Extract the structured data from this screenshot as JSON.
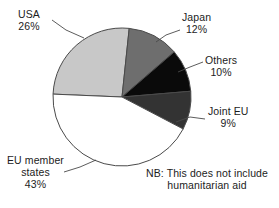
{
  "chart_data": {
    "type": "pie",
    "title": "",
    "subtitle": "",
    "xlabel": "",
    "ylabel": "",
    "legend_position": "none",
    "grid": false,
    "unit": "%",
    "categories": [
      "Japan",
      "Others",
      "Joint EU",
      "EU member states",
      "USA"
    ],
    "values": [
      12,
      10,
      9,
      43,
      26
    ],
    "slices": [
      {
        "id": "japan",
        "label": "Japan",
        "value": 12,
        "value_text": "12%",
        "color": "#6e6e6e",
        "start_angle": 352,
        "end_angle": 395,
        "label_lines": [
          "Japan",
          "12%"
        ]
      },
      {
        "id": "others",
        "label": "Others",
        "value": 10,
        "value_text": "10%",
        "color": "#0a0a0a",
        "start_angle": 395,
        "end_angle": 431,
        "label_lines": [
          "Others",
          "10%"
        ]
      },
      {
        "id": "joint-eu",
        "label": "Joint EU",
        "value": 9,
        "value_text": "9%",
        "color": "#333333",
        "start_angle": 431,
        "end_angle": 463,
        "label_lines": [
          "Joint EU",
          "9%"
        ]
      },
      {
        "id": "eu-member-states",
        "label": "EU member states",
        "value": 43,
        "value_text": "43%",
        "color": "#ffffff",
        "start_angle": 463,
        "end_angle": 618,
        "label_lines": [
          "EU member",
          "states",
          "43%"
        ]
      },
      {
        "id": "usa",
        "label": "USA",
        "value": 26,
        "value_text": "26%",
        "color": "#c8c8c8",
        "start_angle": 618,
        "end_angle": 712,
        "label_lines": [
          "USA",
          "26%"
        ]
      }
    ],
    "annotations": [
      {
        "id": "note",
        "lines": [
          "NB: This does not include",
          "humanitarian aid"
        ]
      }
    ]
  },
  "labels": {
    "usa": {
      "name": "USA",
      "pct": "26%"
    },
    "japan": {
      "name": "Japan",
      "pct": "12%"
    },
    "others": {
      "name": "Others",
      "pct": "10%"
    },
    "joint_eu": {
      "name": "Joint EU",
      "pct": "9%"
    },
    "eu": {
      "name_line1": "EU member",
      "name_line2": "states",
      "pct": "43%"
    }
  },
  "note": {
    "line1": "NB: This does not include",
    "line2": "humanitarian aid"
  },
  "colors": {
    "usa": "#c8c8c8",
    "japan": "#6e6e6e",
    "others": "#0a0a0a",
    "joint_eu": "#333333",
    "eu": "#ffffff",
    "outline": "#4a4a4a",
    "text": "#1c1c1c",
    "background": "#ffffff"
  }
}
